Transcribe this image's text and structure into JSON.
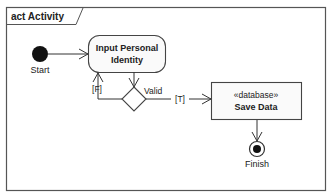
{
  "diagram": {
    "frame": {
      "label": "act Activity"
    },
    "nodes": {
      "start": {
        "label": "Start"
      },
      "input_action": {
        "line1": "Input Personal",
        "line2": "Identity"
      },
      "decision": {
        "label": "Valid"
      },
      "save_action": {
        "stereotype": "«database»",
        "label": "Save Data"
      },
      "finish": {
        "label": "Finish"
      }
    },
    "edges": {
      "false_guard": "[F]",
      "true_guard": "[T]"
    }
  }
}
